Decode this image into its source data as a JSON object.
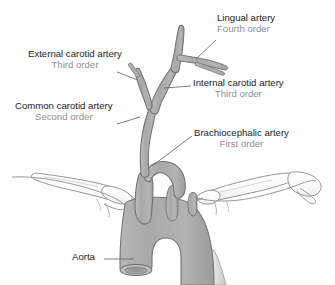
{
  "figure": {
    "colors": {
      "artery_fill": "#ababab",
      "artery_fill_light": "#c9c9c9",
      "artery_outline": "#6f6f6f",
      "bone_fill": "#fdfdfd",
      "bone_outline": "#7a7a7a",
      "leader_line": "#6d6d6d",
      "label_primary": "#1c1c1c",
      "label_order": "#8f8f8f",
      "background": "#ffffff"
    }
  },
  "labels": {
    "lingual": {
      "name": "Lingual artery",
      "order": "Fourth order"
    },
    "external_carotid": {
      "name": "External carotid artery",
      "order": "Third order"
    },
    "internal_carotid": {
      "name": "Internal carotid artery",
      "order": "Third order"
    },
    "common_carotid": {
      "name": "Common carotid artery",
      "order": "Second order"
    },
    "brachiocephalic": {
      "name": "Brachiocephalic artery",
      "order": "First order"
    },
    "aorta": {
      "name": "Aorta"
    }
  },
  "icons": {
    "leader_lingual": "leader-line-icon",
    "leader_external": "leader-line-icon",
    "leader_internal": "leader-line-icon",
    "leader_common": "leader-line-icon",
    "leader_brachio": "leader-line-icon",
    "leader_aorta": "leader-line-icon"
  }
}
